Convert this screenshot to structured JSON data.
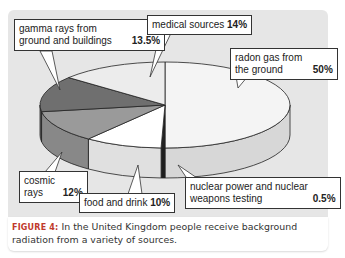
{
  "chart_data": {
    "type": "pie",
    "style": "3d",
    "title": "",
    "slices": [
      {
        "label": "radon gas from the ground",
        "value": 50,
        "display": "50%",
        "color": "#f4f4f4"
      },
      {
        "label": "nuclear power and nuclear weapons testing",
        "value": 0.5,
        "display": "0.5%",
        "color": "#222222"
      },
      {
        "label": "food and drink",
        "value": 10,
        "display": "10%",
        "color": "#ffffff"
      },
      {
        "label": "cosmic rays",
        "value": 12,
        "display": "12%",
        "color": "#9a9a9a"
      },
      {
        "label": "gamma rays from ground and buildings",
        "value": 13.5,
        "display": "13.5%",
        "color": "#6f6f6f"
      },
      {
        "label": "medical sources",
        "value": 14,
        "display": "14%",
        "color": "#ececec"
      }
    ]
  },
  "callouts": {
    "gamma": {
      "text": "gamma rays from ground and buildings",
      "value": "13.5%"
    },
    "medical": {
      "text": "medical sources",
      "value": "14%"
    },
    "radon": {
      "text": "radon gas from the ground",
      "value": "50%"
    },
    "cosmic": {
      "text": "cosmic rays",
      "value": "12%"
    },
    "food": {
      "text": "food and drink",
      "value": "10%"
    },
    "nuclear": {
      "text": "nuclear power and nuclear weapons testing",
      "value": "0.5%"
    }
  },
  "caption": {
    "label": "FIGURE 4:",
    "text": "In the United Kingdom people receive background radiation from a variety of sources."
  }
}
